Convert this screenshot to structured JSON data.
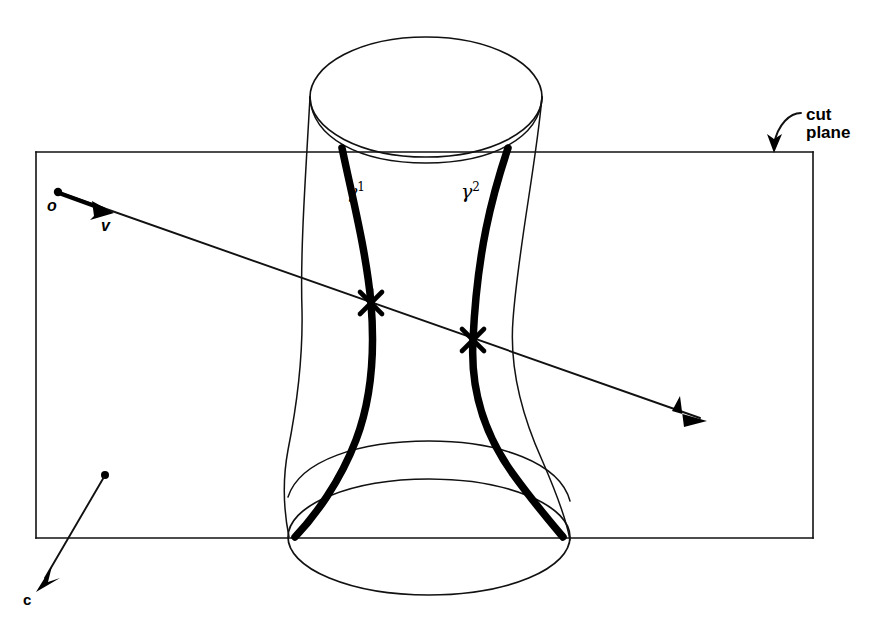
{
  "figure": {
    "background_color": "#ffffff",
    "ink_color": "#000000",
    "width": 882,
    "height": 633
  },
  "labels": {
    "origin": "o",
    "direction": "v",
    "curve_left": "γ",
    "curve_left_superscript": "1",
    "curve_right": "γ",
    "curve_right_superscript": "2",
    "cut_plane_line1": "cut",
    "cut_plane_line2": "plane",
    "center": "c"
  },
  "cut_plane": {
    "name": "cut plane",
    "rect": {
      "x": 36,
      "y": 152,
      "width": 777,
      "height": 386
    },
    "stroke_color": "#111111"
  },
  "surface": {
    "name": "surface of revolution",
    "top_ellipse": {
      "cx": 426,
      "cy": 97,
      "rx": 116,
      "ry": 60
    },
    "bottom_ellipse": {
      "cx": 429,
      "cy": 537,
      "rx": 141,
      "ry": 58
    },
    "silhouette_stroke": "#111111"
  },
  "geodesics": [
    {
      "name": "gamma-1",
      "label": "γ¹",
      "label_x": 352,
      "label_y": 190
    },
    {
      "name": "gamma-2",
      "label": "γ²",
      "label_x": 466,
      "label_y": 190
    }
  ],
  "ray": {
    "origin_point": {
      "x": 58,
      "y": 192
    },
    "direction_arrow_tip": {
      "x": 112,
      "y": 212
    },
    "end_arrow_tip": {
      "x": 707,
      "y": 421
    },
    "stroke_color": "#111111"
  },
  "intersections": [
    {
      "name": "intersection-gamma-1",
      "x": 371,
      "y": 303
    },
    {
      "name": "intersection-gamma-2",
      "x": 473,
      "y": 340
    }
  ],
  "center_marker": {
    "dot": {
      "x": 105,
      "y": 475
    },
    "arrow_tip": {
      "x": 38,
      "y": 588
    }
  }
}
